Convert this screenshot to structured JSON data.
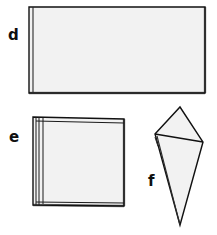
{
  "figure": {
    "background_color": "#ffffff",
    "width": 217,
    "height": 235,
    "paper_fill": "#f2f2f2",
    "edge_color": "#111111",
    "shadow_color": "#7d7d7d",
    "label_color": "#101010"
  },
  "steps": [
    {
      "id": "d",
      "label": "d",
      "shape_name": "folded-rectangle",
      "description": "Horizontal rectangle of folded paper with a fold line along the left edge and a shaded right and bottom edge",
      "label_position": {
        "x": 8,
        "y": 40
      },
      "outline_points": "29,7 205,7 205,93 29,93",
      "fold_lines": [
        {
          "name": "left-fold",
          "points": "33,7 33,93"
        }
      ],
      "shadow_edges": [
        {
          "name": "right-shadow",
          "points": "205,7 205,93"
        },
        {
          "name": "bottom-shadow",
          "points": "29,93 205,93"
        }
      ]
    },
    {
      "id": "e",
      "label": "e",
      "shape_name": "layered-square",
      "description": "Square of paper folded into multiple stacked layers, visible as several thin lines along the left edge",
      "label_position": {
        "x": 9,
        "y": 142
      },
      "outline_points": "33,117 124,119 124,206 33,205",
      "fold_lines": [
        {
          "name": "layer-1",
          "points": "36,117 36,205"
        },
        {
          "name": "layer-2",
          "points": "39,117 39,205"
        },
        {
          "name": "layer-3",
          "points": "43,118 43,204"
        },
        {
          "name": "top-layer-edge",
          "points": "36,121 124,123"
        },
        {
          "name": "bottom-layer-edge",
          "points": "36,202 124,203"
        }
      ],
      "shadow_edges": [
        {
          "name": "right-shadow",
          "points": "124,119 124,206"
        },
        {
          "name": "bottom-shadow",
          "points": "33,205 124,206"
        }
      ]
    },
    {
      "id": "f",
      "label": "f",
      "shape_name": "folded-cone",
      "description": "Paper folded into a cone or kite shape, with an upper triangular flap folded over a long tapering point",
      "label_position": {
        "x": 148,
        "y": 186
      },
      "outline_points": "180,107 203,142 180,225 155,134",
      "fold_lines": [
        {
          "name": "flap-fold",
          "points": "155,134 203,142"
        },
        {
          "name": "inner-crease",
          "points": "157,136 180,225"
        },
        {
          "name": "left-layer",
          "points": "155,137 158,146"
        }
      ],
      "shadow_edges": []
    }
  ]
}
